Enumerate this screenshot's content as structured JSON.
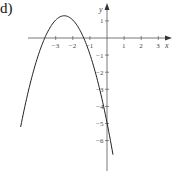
{
  "figure": {
    "label": "d)"
  },
  "chart_data": {
    "type": "line",
    "title": "",
    "panel_label": "d)",
    "xlabel": "x",
    "ylabel": "y",
    "x_ticks": [
      -3,
      -2,
      -1,
      1,
      2,
      3
    ],
    "y_ticks": [
      1,
      -1,
      -2,
      -3,
      -4,
      -5,
      -6
    ],
    "xlim": [
      -5,
      3.7
    ],
    "ylim": [
      -7.5,
      2
    ],
    "grid": false,
    "legend": null,
    "series": [
      {
        "name": "parabola",
        "description": "downward-opening parabola, vertex ≈ (-2.5, 1.3), y-intercept ≈ -4.7",
        "approx_equation": "y = -(x + 2.5)^2 + 1.3",
        "x": [
          -5,
          -4.5,
          -4,
          -3.64,
          -3.5,
          -3,
          -2.5,
          -2,
          -1.5,
          -1.36,
          -1,
          -0.5,
          0,
          0.35
        ],
        "y": [
          -5.0,
          -2.7,
          -0.95,
          0,
          0.3,
          1.05,
          1.3,
          1.05,
          0.3,
          0,
          -0.95,
          -2.7,
          -4.95,
          -6.7
        ]
      }
    ]
  }
}
